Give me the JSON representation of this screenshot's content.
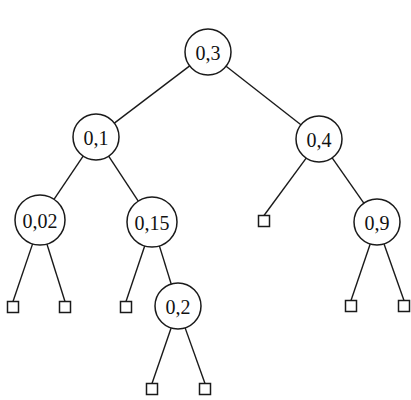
{
  "diagram": {
    "type": "binary-search-tree",
    "nodes": [
      {
        "id": "n03",
        "label": "0,3",
        "x": 208,
        "y": 52,
        "r": 23
      },
      {
        "id": "n01",
        "label": "0,1",
        "x": 96,
        "y": 137,
        "r": 23
      },
      {
        "id": "n04",
        "label": "0,4",
        "x": 319,
        "y": 139,
        "r": 23
      },
      {
        "id": "n002",
        "label": "0,02",
        "x": 40,
        "y": 220,
        "r": 25
      },
      {
        "id": "n015",
        "label": "0,15",
        "x": 152,
        "y": 222,
        "r": 25
      },
      {
        "id": "n09",
        "label": "0,9",
        "x": 377,
        "y": 222,
        "r": 23
      },
      {
        "id": "n02",
        "label": "0,2",
        "x": 178,
        "y": 306,
        "r": 23
      }
    ],
    "leaves": [
      {
        "id": "l1",
        "x": 13,
        "y": 307
      },
      {
        "id": "l2",
        "x": 65,
        "y": 307
      },
      {
        "id": "l3",
        "x": 126,
        "y": 307
      },
      {
        "id": "l4",
        "x": 264,
        "y": 221
      },
      {
        "id": "l5",
        "x": 351,
        "y": 306
      },
      {
        "id": "l6",
        "x": 404,
        "y": 306
      },
      {
        "id": "l7",
        "x": 152,
        "y": 389
      },
      {
        "id": "l8",
        "x": 205,
        "y": 389
      }
    ],
    "edges": [
      [
        "n03",
        "n01"
      ],
      [
        "n03",
        "n04"
      ],
      [
        "n01",
        "n002"
      ],
      [
        "n01",
        "n015"
      ],
      [
        "n04",
        "l4"
      ],
      [
        "n04",
        "n09"
      ],
      [
        "n002",
        "l1"
      ],
      [
        "n002",
        "l2"
      ],
      [
        "n015",
        "l3"
      ],
      [
        "n015",
        "n02"
      ],
      [
        "n09",
        "l5"
      ],
      [
        "n09",
        "l6"
      ],
      [
        "n02",
        "l7"
      ],
      [
        "n02",
        "l8"
      ]
    ],
    "leaf_size": 11
  }
}
